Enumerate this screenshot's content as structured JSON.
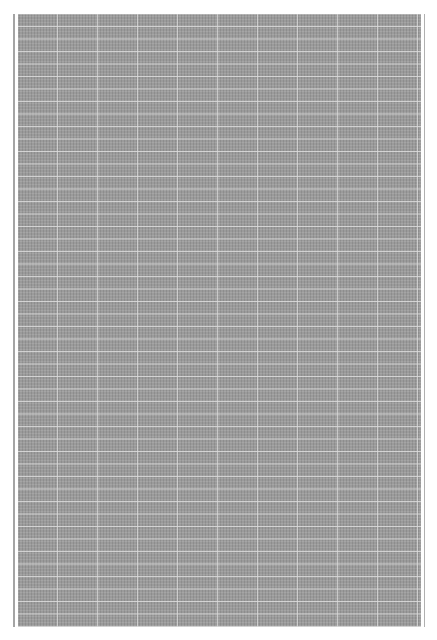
{
  "document": {
    "type": "graph-paper-scan",
    "header_text": "",
    "sheet": {
      "fill_color": "#9b9b9b",
      "grid_line_color": "#dcdcdc",
      "horizontal_line_spacing_px": 12.5,
      "vertical_line_spacing_px": 40
    },
    "margin_rules": {
      "left_color": "#a4a4a4",
      "right_color": "#b0b0b0"
    }
  }
}
